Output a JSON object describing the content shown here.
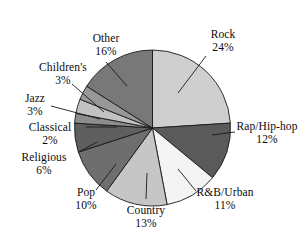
{
  "chart_data": {
    "type": "pie",
    "title": "",
    "subtitle": "",
    "xlabel": "",
    "ylabel": "",
    "legend_position": "none",
    "grid": false,
    "units": "percent",
    "start_angle_deg": 0,
    "direction": "clockwise",
    "categories": [
      "Rock",
      "Rap/Hip-hop",
      "R&B/Urban",
      "Country",
      "Pop",
      "Religious",
      "Classical",
      "Jazz",
      "Children's",
      "Other"
    ],
    "values": [
      24,
      12,
      11,
      13,
      10,
      6,
      2,
      3,
      3,
      16
    ],
    "slices": [
      {
        "label": "Rock",
        "percent": 24,
        "percent_text": "24%",
        "color": "#cfcfcf"
      },
      {
        "label": "Rap/Hip-hop",
        "percent": 12,
        "percent_text": "12%",
        "color": "#5a5a5b"
      },
      {
        "label": "R&B/Urban",
        "percent": 11,
        "percent_text": "11%",
        "color": "#f4f4f4"
      },
      {
        "label": "Country",
        "percent": 13,
        "percent_text": "13%",
        "color": "#c6c6c6"
      },
      {
        "label": "Pop",
        "percent": 10,
        "percent_text": "10%",
        "color": "#6e6e6f"
      },
      {
        "label": "Religious",
        "percent": 6,
        "percent_text": "6%",
        "color": "#5f5f60"
      },
      {
        "label": "Classical",
        "percent": 2,
        "percent_text": "2%",
        "color": "#8d8d8e"
      },
      {
        "label": "Jazz",
        "percent": 3,
        "percent_text": "3%",
        "color": "#c2c2c2"
      },
      {
        "label": "Children's",
        "percent": 3,
        "percent_text": "3%",
        "color": "#989899"
      },
      {
        "label": "Other",
        "percent": 16,
        "percent_text": "16%",
        "color": "#787879"
      }
    ]
  },
  "labels": {
    "rock": {
      "name": "Rock",
      "percent": "24%"
    },
    "rap": {
      "name": "Rap/Hip-hop",
      "percent": "12%"
    },
    "rnb": {
      "name": "R&B/Urban",
      "percent": "11%"
    },
    "country": {
      "name": "Country",
      "percent": "13%"
    },
    "pop": {
      "name": "Pop",
      "percent": "10%"
    },
    "religious": {
      "name": "Religious",
      "percent": "6%"
    },
    "classical": {
      "name": "Classical",
      "percent": "2%"
    },
    "jazz": {
      "name": "Jazz",
      "percent": "3%"
    },
    "childrens": {
      "name": "Children's",
      "percent": "3%"
    },
    "other": {
      "name": "Other",
      "percent": "16%"
    }
  },
  "colors": {
    "outline": "#1a1a1a",
    "leader_line": "#1a1a1a",
    "background": "#ffffff",
    "text": "#0b0b0b"
  }
}
